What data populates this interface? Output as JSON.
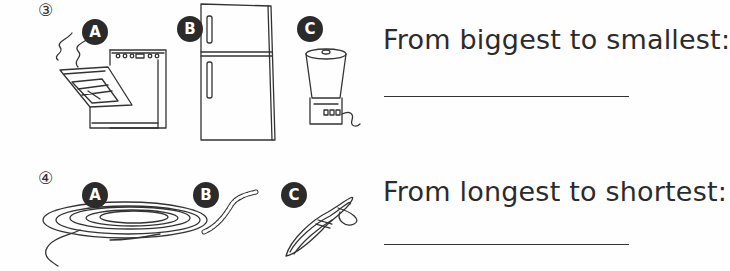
{
  "questions": [
    {
      "number": "③",
      "items": [
        {
          "label": "A",
          "object": "oven"
        },
        {
          "label": "B",
          "object": "refrigerator"
        },
        {
          "label": "C",
          "object": "blender"
        }
      ],
      "prompt": "From biggest to smallest:",
      "answer": ""
    },
    {
      "number": "④",
      "items": [
        {
          "label": "A",
          "object": "long coiled rope"
        },
        {
          "label": "B",
          "object": "short rope"
        },
        {
          "label": "C",
          "object": "tied rope bundle"
        }
      ],
      "prompt": "From longest to shortest:",
      "answer": ""
    }
  ]
}
